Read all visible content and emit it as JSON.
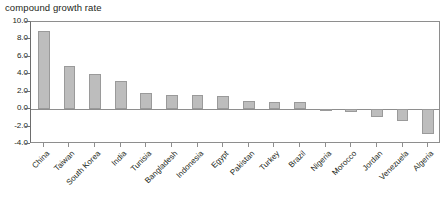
{
  "chart_data": {
    "type": "bar",
    "title": "compound growth rate",
    "xlabel": "",
    "ylabel": "",
    "ylim": [
      -4.0,
      10.0
    ],
    "ytick_labels": [
      "10.0",
      "8.0",
      "6.0",
      "4.0",
      "2.0",
      "0.0",
      "-2.0",
      "-4.0"
    ],
    "ytick_values": [
      10.0,
      8.0,
      6.0,
      4.0,
      2.0,
      0.0,
      -2.0,
      -4.0
    ],
    "grid": false,
    "legend": "none",
    "orientation": "vertical",
    "bar_color": "#bdbdbd",
    "bar_border_color": "#9a9a9a",
    "axis_color": "#8e8e8e",
    "categories": [
      "China",
      "Taiwan",
      "South Korea",
      "India",
      "Tunisia",
      "Bangladesh",
      "Indonesia",
      "Egypt",
      "Pakistan",
      "Turkey",
      "Brazil",
      "Nigeria",
      "Morocco",
      "Jordan",
      "Venezuela",
      "Algeria"
    ],
    "values": [
      9.0,
      4.9,
      4.0,
      3.2,
      1.9,
      1.6,
      1.6,
      1.5,
      0.9,
      0.8,
      0.8,
      -0.1,
      -0.3,
      -0.9,
      -1.4,
      -2.8
    ]
  }
}
